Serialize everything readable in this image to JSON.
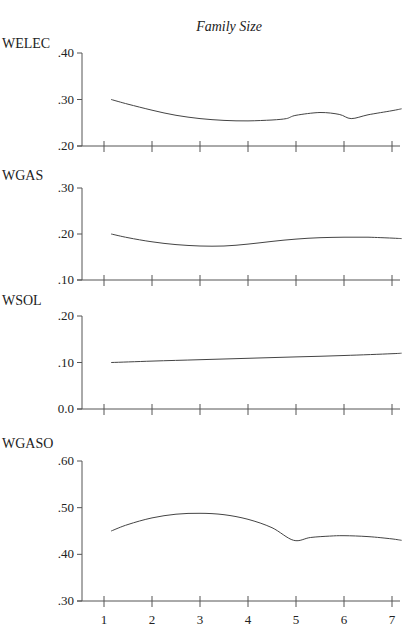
{
  "chart_data": {
    "type": "line",
    "title": "Family Size",
    "xlabel": "Family Size",
    "x_ticks": [
      1,
      2,
      3,
      4,
      5,
      6,
      7
    ],
    "grid": false,
    "legend": "none",
    "panels": [
      {
        "name": "WELEC",
        "ylabel": "WELEC",
        "ylim": [
          0.2,
          0.4
        ],
        "y_ticks": [
          ".40",
          ".30",
          ".20"
        ],
        "y_tick_values": [
          0.4,
          0.3,
          0.2
        ],
        "x": [
          1.15,
          1.5,
          2,
          2.5,
          3,
          3.5,
          4,
          4.5,
          4.8,
          5.0,
          5.5,
          5.9,
          6.15,
          6.5,
          7,
          7.2
        ],
        "values": [
          0.3,
          0.29,
          0.277,
          0.266,
          0.259,
          0.255,
          0.254,
          0.256,
          0.259,
          0.266,
          0.272,
          0.268,
          0.259,
          0.267,
          0.276,
          0.28
        ]
      },
      {
        "name": "WGAS",
        "ylabel": "WGAS",
        "ylim": [
          0.1,
          0.3
        ],
        "y_ticks": [
          ".30",
          ".20",
          ".10"
        ],
        "y_tick_values": [
          0.3,
          0.2,
          0.1
        ],
        "x": [
          1.15,
          1.5,
          2,
          2.5,
          3,
          3.5,
          4,
          4.5,
          5,
          5.5,
          6,
          6.5,
          7,
          7.2
        ],
        "values": [
          0.2,
          0.192,
          0.183,
          0.177,
          0.174,
          0.174,
          0.178,
          0.184,
          0.189,
          0.192,
          0.193,
          0.193,
          0.191,
          0.19
        ]
      },
      {
        "name": "WSOL",
        "ylabel": "WSOL",
        "ylim": [
          0.0,
          0.2
        ],
        "y_ticks": [
          ".20",
          ".10",
          "0.0"
        ],
        "y_tick_values": [
          0.2,
          0.1,
          0.0
        ],
        "x": [
          1.15,
          2,
          3,
          4,
          5,
          6,
          7,
          7.2
        ],
        "values": [
          0.1,
          0.103,
          0.106,
          0.109,
          0.112,
          0.115,
          0.119,
          0.12
        ]
      },
      {
        "name": "WGASO",
        "ylabel": "WGASO",
        "ylim": [
          0.3,
          0.6
        ],
        "y_ticks": [
          ".60",
          ".50",
          ".40",
          ".30"
        ],
        "y_tick_values": [
          0.6,
          0.5,
          0.4,
          0.3
        ],
        "x": [
          1.15,
          1.5,
          2,
          2.5,
          3,
          3.5,
          4,
          4.5,
          4.95,
          5.3,
          5.7,
          6,
          6.5,
          7,
          7.2
        ],
        "values": [
          0.45,
          0.464,
          0.478,
          0.486,
          0.488,
          0.485,
          0.475,
          0.457,
          0.43,
          0.436,
          0.439,
          0.44,
          0.438,
          0.433,
          0.43
        ]
      }
    ]
  },
  "layout": {
    "axis_x_left": 82,
    "x_tick_px": [
      104,
      152,
      200,
      248,
      296,
      344,
      392
    ],
    "axis_x_right": 400,
    "panels_px": [
      {
        "title_y": 48,
        "top": 53,
        "bottom": 146
      },
      {
        "title_y": 180,
        "top": 188,
        "bottom": 280
      },
      {
        "title_y": 305,
        "top": 316,
        "bottom": 409
      },
      {
        "title_y": 448,
        "top": 461,
        "bottom": 601
      }
    ]
  },
  "colors": {
    "axis": "#555555",
    "curve": "#444444",
    "text": "#222222"
  }
}
